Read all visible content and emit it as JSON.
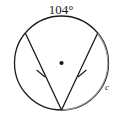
{
  "figure": {
    "type": "geometry-diagram",
    "background_color": "#ffffff",
    "stroke_color": "#1a1a1a",
    "arc_highlight_color": "#9a9a9a",
    "labels": {
      "arc_angle": "104°",
      "arc_name": "c"
    },
    "circle": {
      "center_x": 61.5,
      "center_y": 63,
      "radius": 47,
      "center_dot_radius": 2.1,
      "stroke_width": 1.3
    },
    "inscribed_angle": {
      "vertex_x": 61.5,
      "vertex_y": 110,
      "left_endpoint_x": 25.5,
      "left_endpoint_y": 33.5,
      "right_endpoint_x": 97.5,
      "right_endpoint_y": 33.5,
      "stroke_width": 1.3
    },
    "tick_marks": {
      "count": 2,
      "description": "congruence-hash-marks-on-chords",
      "left": {
        "x": 40.5,
        "y": 73.5,
        "angle": -39
      },
      "right": {
        "x": 82.5,
        "y": 73.5,
        "angle": 39
      },
      "length": 9,
      "stroke_width": 1.1
    },
    "arc_label_positions": {
      "angle_label_x": 61,
      "angle_label_y": 13,
      "name_label_x": 107,
      "name_label_y": 89
    },
    "arc_highlight": {
      "description": "right-arc-c-from-right-endpoint-to-vertex",
      "start_x": 97.5,
      "start_y": 33.5,
      "end_x": 61.5,
      "end_y": 110,
      "stroke_width": 1.1
    }
  }
}
